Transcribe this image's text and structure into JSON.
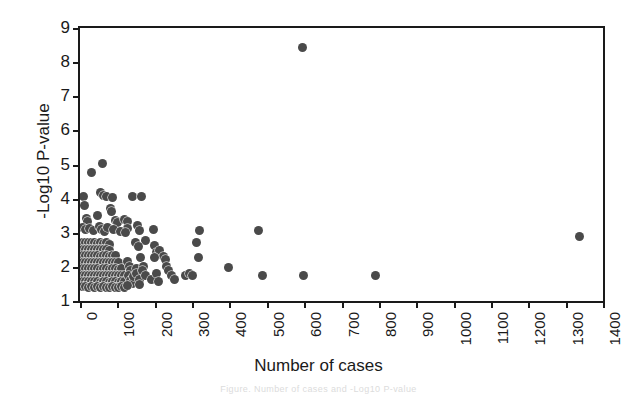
{
  "chart_data": {
    "type": "scatter",
    "title": "",
    "xlabel": "Number of cases",
    "ylabel": "-Log10 P-value",
    "xlim": [
      0,
      1400
    ],
    "ylim": [
      1,
      9
    ],
    "xticks": [
      0,
      100,
      200,
      300,
      400,
      500,
      600,
      700,
      800,
      900,
      1000,
      1100,
      1200,
      1300,
      1400
    ],
    "yticks": [
      1,
      2,
      3,
      4,
      5,
      6,
      7,
      8,
      9
    ],
    "xtick_labels": [
      "0",
      "100",
      "200",
      "300",
      "400",
      "500",
      "600",
      "700",
      "800",
      "900",
      "1000",
      "1100",
      "1200",
      "1300",
      "1400"
    ],
    "ytick_labels": [
      "1",
      "2",
      "3",
      "4",
      "5",
      "6",
      "7",
      "8",
      "9"
    ],
    "grid": false,
    "legend": null,
    "marker": {
      "shape": "circle",
      "color": "#4a4a4a",
      "size_px": 9,
      "edge_color": "#ffffff"
    },
    "series": [
      {
        "name": "Associations",
        "points": [
          [
            595,
            8.43
          ],
          [
            60,
            5.02
          ],
          [
            30,
            4.78
          ],
          [
            10,
            4.07
          ],
          [
            12,
            3.8
          ],
          [
            55,
            4.17
          ],
          [
            62,
            4.1
          ],
          [
            72,
            4.07
          ],
          [
            140,
            4.06
          ],
          [
            165,
            4.07
          ],
          [
            88,
            4.04
          ],
          [
            82,
            3.72
          ],
          [
            85,
            3.62
          ],
          [
            48,
            3.5
          ],
          [
            18,
            3.41
          ],
          [
            20,
            3.33
          ],
          [
            95,
            3.36
          ],
          [
            100,
            3.3
          ],
          [
            118,
            3.4
          ],
          [
            126,
            3.33
          ],
          [
            128,
            3.12
          ],
          [
            8,
            3.16
          ],
          [
            14,
            3.1
          ],
          [
            26,
            3.12
          ],
          [
            35,
            3.08
          ],
          [
            52,
            3.18
          ],
          [
            58,
            3.1
          ],
          [
            66,
            3.05
          ],
          [
            74,
            3.14
          ],
          [
            90,
            3.09
          ],
          [
            108,
            3.04
          ],
          [
            122,
            3.01
          ],
          [
            153,
            3.22
          ],
          [
            160,
            3.06
          ],
          [
            196,
            3.1
          ],
          [
            320,
            3.06
          ],
          [
            175,
            2.77
          ],
          [
            200,
            2.62
          ],
          [
            205,
            2.42
          ],
          [
            148,
            2.7
          ],
          [
            156,
            2.6
          ],
          [
            214,
            2.48
          ],
          [
            224,
            2.3
          ],
          [
            230,
            2.22
          ],
          [
            200,
            2.28
          ],
          [
            8,
            2.72
          ],
          [
            16,
            2.7
          ],
          [
            24,
            2.7
          ],
          [
            32,
            2.71
          ],
          [
            40,
            2.7
          ],
          [
            48,
            2.69
          ],
          [
            56,
            2.7
          ],
          [
            64,
            2.68
          ],
          [
            72,
            2.7
          ],
          [
            80,
            2.66
          ],
          [
            8,
            2.52
          ],
          [
            16,
            2.52
          ],
          [
            24,
            2.51
          ],
          [
            32,
            2.52
          ],
          [
            40,
            2.5
          ],
          [
            48,
            2.51
          ],
          [
            56,
            2.5
          ],
          [
            64,
            2.52
          ],
          [
            72,
            2.5
          ],
          [
            80,
            2.49
          ],
          [
            8,
            2.33
          ],
          [
            16,
            2.33
          ],
          [
            24,
            2.32
          ],
          [
            32,
            2.33
          ],
          [
            40,
            2.32
          ],
          [
            48,
            2.33
          ],
          [
            56,
            2.31
          ],
          [
            64,
            2.33
          ],
          [
            72,
            2.32
          ],
          [
            80,
            2.31
          ],
          [
            88,
            2.33
          ],
          [
            96,
            2.32
          ],
          [
            8,
            2.14
          ],
          [
            16,
            2.14
          ],
          [
            24,
            2.13
          ],
          [
            32,
            2.14
          ],
          [
            40,
            2.13
          ],
          [
            48,
            2.14
          ],
          [
            56,
            2.12
          ],
          [
            64,
            2.14
          ],
          [
            72,
            2.13
          ],
          [
            80,
            2.12
          ],
          [
            88,
            2.14
          ],
          [
            96,
            2.13
          ],
          [
            104,
            2.12
          ],
          [
            8,
            1.95
          ],
          [
            16,
            1.95
          ],
          [
            24,
            1.94
          ],
          [
            32,
            1.95
          ],
          [
            40,
            1.94
          ],
          [
            48,
            1.95
          ],
          [
            56,
            1.93
          ],
          [
            64,
            1.95
          ],
          [
            72,
            1.94
          ],
          [
            80,
            1.93
          ],
          [
            88,
            1.95
          ],
          [
            96,
            1.94
          ],
          [
            104,
            1.93
          ],
          [
            112,
            1.95
          ],
          [
            8,
            1.76
          ],
          [
            16,
            1.76
          ],
          [
            24,
            1.75
          ],
          [
            32,
            1.76
          ],
          [
            40,
            1.75
          ],
          [
            48,
            1.76
          ],
          [
            56,
            1.74
          ],
          [
            64,
            1.76
          ],
          [
            72,
            1.75
          ],
          [
            80,
            1.74
          ],
          [
            88,
            1.76
          ],
          [
            96,
            1.75
          ],
          [
            104,
            1.74
          ],
          [
            112,
            1.76
          ],
          [
            120,
            1.75
          ],
          [
            8,
            1.57
          ],
          [
            16,
            1.57
          ],
          [
            24,
            1.56
          ],
          [
            32,
            1.57
          ],
          [
            40,
            1.56
          ],
          [
            48,
            1.57
          ],
          [
            56,
            1.55
          ],
          [
            64,
            1.57
          ],
          [
            72,
            1.56
          ],
          [
            80,
            1.55
          ],
          [
            88,
            1.57
          ],
          [
            96,
            1.56
          ],
          [
            104,
            1.55
          ],
          [
            112,
            1.57
          ],
          [
            120,
            1.56
          ],
          [
            8,
            1.42
          ],
          [
            16,
            1.42
          ],
          [
            24,
            1.41
          ],
          [
            32,
            1.42
          ],
          [
            40,
            1.41
          ],
          [
            48,
            1.42
          ],
          [
            56,
            1.4
          ],
          [
            64,
            1.42
          ],
          [
            72,
            1.41
          ],
          [
            80,
            1.4
          ],
          [
            88,
            1.42
          ],
          [
            96,
            1.41
          ],
          [
            104,
            1.4
          ],
          [
            112,
            1.42
          ],
          [
            120,
            1.41
          ],
          [
            128,
            2.16
          ],
          [
            132,
            2.02
          ],
          [
            136,
            1.88
          ],
          [
            130,
            1.74
          ],
          [
            134,
            1.6
          ],
          [
            140,
            1.5
          ],
          [
            126,
            1.45
          ],
          [
            144,
            1.72
          ],
          [
            150,
            1.95
          ],
          [
            152,
            1.8
          ],
          [
            158,
            1.62
          ],
          [
            160,
            1.48
          ],
          [
            163,
            2.28
          ],
          [
            170,
            2.02
          ],
          [
            168,
            1.88
          ],
          [
            176,
            1.75
          ],
          [
            192,
            1.62
          ],
          [
            206,
            1.8
          ],
          [
            210,
            1.56
          ],
          [
            232,
            2.02
          ],
          [
            238,
            1.9
          ],
          [
            246,
            1.74
          ],
          [
            252,
            1.62
          ],
          [
            282,
            1.76
          ],
          [
            292,
            1.8
          ],
          [
            300,
            1.74
          ],
          [
            312,
            2.7
          ],
          [
            318,
            2.28
          ],
          [
            398,
            1.98
          ],
          [
            478,
            3.06
          ],
          [
            488,
            1.76
          ],
          [
            598,
            1.76
          ],
          [
            792,
            1.76
          ],
          [
            1337,
            2.9
          ]
        ]
      }
    ]
  },
  "axes": {
    "x_title": "Number of cases",
    "y_title": "-Log10 P-value"
  },
  "caption": {
    "text": "Figure. Number of cases and -Log10 P-value"
  }
}
